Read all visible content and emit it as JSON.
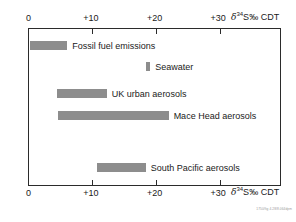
{
  "chart_data": {
    "type": "bar",
    "orientation": "horizontal",
    "title": "",
    "xlabel": "δ34S‰ CDT",
    "ylabel": "",
    "xlim": [
      0,
      39.7
    ],
    "grid": false,
    "legend": null,
    "axis_label_parts": {
      "symbol": "δ",
      "superscript": "34",
      "element": "S",
      "permil": "‰",
      "standard": "CDT"
    },
    "tick_labels": [
      "0",
      "+10",
      "+20",
      "+30"
    ],
    "tick_values": [
      0,
      10,
      20,
      30
    ],
    "categories": [
      "Fossil fuel emissions",
      "Seawater",
      "UK urban aerosols",
      "Mace Head aerosols",
      "South Pacific aerosols"
    ],
    "ranges": [
      {
        "label": "Fossil fuel emissions",
        "start": 0.2,
        "end": 6.1
      },
      {
        "label": "Seawater",
        "start": 18.4,
        "end": 19.1
      },
      {
        "label": "UK urban aerosols",
        "start": 4.4,
        "end": 12.3
      },
      {
        "label": "Mace Head aerosols",
        "start": 4.6,
        "end": 22.0
      },
      {
        "label": "South Pacific aerosols",
        "start": 10.7,
        "end": 18.4
      }
    ],
    "bar_color": "#8d8d8d",
    "axis_color": "#2b2b2b"
  },
  "figure": {
    "plate_id": "1750/fig 4.28/8.064dpm"
  }
}
